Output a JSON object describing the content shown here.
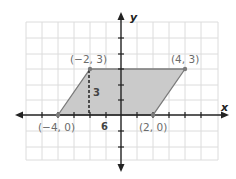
{
  "figure": {
    "type": "coordinate-plane-parallelogram",
    "axes": {
      "x_label": "x",
      "y_label": "y"
    },
    "grid": {
      "x_range": [
        -6,
        6
      ],
      "y_range": [
        -5,
        5
      ]
    },
    "vertices": [
      {
        "label": "(−4, 0)",
        "x": -4,
        "y": 0
      },
      {
        "label": "(−2, 3)",
        "x": -2,
        "y": 3
      },
      {
        "label": "(4, 3)",
        "x": 4,
        "y": 3
      },
      {
        "label": "(2, 0)",
        "x": 2,
        "y": 0
      }
    ],
    "height_label": "3",
    "base_label": "6",
    "colors": {
      "fill": "#c8c8c8",
      "edge": "#7a7a7a",
      "grid": "#d9d9d9",
      "axis": "#222222",
      "height_line": "#222222"
    }
  }
}
